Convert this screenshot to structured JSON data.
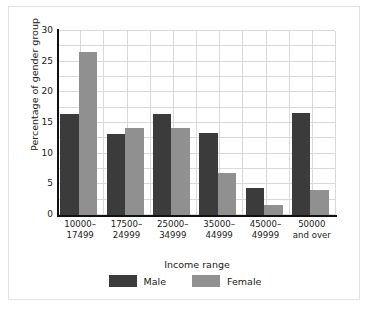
{
  "chart_data": {
    "type": "bar",
    "title": "",
    "subtitle": "",
    "xlabel": "Income range",
    "ylabel": "Percentage of gender group",
    "categories": [
      "10000–\n17499",
      "17500–\n24999",
      "25000–\n34999",
      "35000–\n44999",
      "45000–\n49999",
      "50000\nand over"
    ],
    "category_lines": [
      [
        "10000–",
        "17499"
      ],
      [
        "17500–",
        "24999"
      ],
      [
        "25000–",
        "34999"
      ],
      [
        "35000–",
        "44999"
      ],
      [
        "45000–",
        "49999"
      ],
      [
        "50000",
        "and over"
      ]
    ],
    "series": [
      {
        "name": "Male",
        "color": "#3b3b3b",
        "values": [
          16.5,
          13.2,
          16.5,
          13.4,
          4.4,
          16.6
        ]
      },
      {
        "name": "Female",
        "color": "#909090",
        "values": [
          26.5,
          14.2,
          14.2,
          6.8,
          1.7,
          4.1
        ]
      }
    ],
    "ylim": [
      0,
      30
    ],
    "ytick_values": [
      0,
      5,
      10,
      15,
      20,
      25,
      30
    ],
    "ytick_labels": [
      "0",
      "5",
      "10",
      "15",
      "20",
      "25",
      "30"
    ],
    "grid": true,
    "grid_horizontal_step": 2.5,
    "legend_position": "bottom",
    "legend_entries": [
      {
        "label": "Male",
        "color": "#3b3b3b"
      },
      {
        "label": "Female",
        "color": "#909090"
      }
    ]
  },
  "colors": {
    "male": "#3b3b3b",
    "female": "#909090",
    "grid": "#d9d9d9",
    "axis": "#111111",
    "frame": "#e2e2e2",
    "background": "#ffffff"
  }
}
